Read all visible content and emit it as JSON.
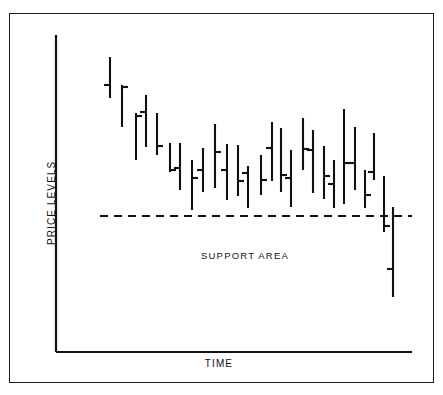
{
  "figure": {
    "frame": {
      "x": 9,
      "y": 13,
      "w": 425,
      "h": 370
    }
  },
  "labels": {
    "y_axis": "PRICE LEVELS",
    "x_axis": "TIME",
    "annotation": "SUPPORT AREA"
  },
  "colors": {
    "ink": "#111111",
    "background": "#ffffff"
  },
  "chart_data": {
    "type": "ohlc-bar",
    "title": "",
    "xlabel": "TIME",
    "ylabel": "PRICE LEVELS",
    "grid": false,
    "legend": "none",
    "axes": {
      "x_axis_y": 352,
      "x_axis_x0": 56,
      "x_axis_x1": 412,
      "y_axis_x": 56,
      "y_axis_y0": 35,
      "y_axis_y1": 352
    },
    "annotations": [
      {
        "text": "SUPPORT AREA",
        "x": 245,
        "y": 255
      },
      {
        "type": "support-line",
        "label": "support level",
        "y": 216,
        "x0": 100,
        "x1": 412,
        "style": "dashed"
      }
    ],
    "note": "Downtrend bar chart breaking below a horizontal support level. Values are pixel y-coordinates: smaller y = higher price.",
    "bars": [
      {
        "i": 1,
        "x": 110,
        "high": 57,
        "low": 98,
        "open": 85,
        "close": null
      },
      {
        "i": 2,
        "x": 122,
        "high": 85,
        "low": 127,
        "open": null,
        "close": 87
      },
      {
        "i": 3,
        "x": 136,
        "high": 113,
        "low": 160,
        "open": null,
        "close": 116
      },
      {
        "i": 4,
        "x": 146,
        "high": 95,
        "low": 147,
        "open": 112,
        "close": null
      },
      {
        "i": 5,
        "x": 157,
        "high": 113,
        "low": 155,
        "open": null,
        "close": 146
      },
      {
        "i": 6,
        "x": 170,
        "high": 143,
        "low": 172,
        "open": null,
        "close": 170
      },
      {
        "i": 7,
        "x": 180,
        "high": 143,
        "low": 190,
        "open": 168,
        "close": null
      },
      {
        "i": 8,
        "x": 192,
        "high": 160,
        "low": 210,
        "open": null,
        "close": 178
      },
      {
        "i": 9,
        "x": 203,
        "high": 148,
        "low": 192,
        "open": 170,
        "close": null
      },
      {
        "i": 10,
        "x": 215,
        "high": 124,
        "low": 188,
        "open": null,
        "close": 152
      },
      {
        "i": 11,
        "x": 227,
        "high": 144,
        "low": 200,
        "open": 170,
        "close": null
      },
      {
        "i": 12,
        "x": 238,
        "high": 145,
        "low": 196,
        "open": null,
        "close": 181
      },
      {
        "i": 13,
        "x": 248,
        "high": 166,
        "low": 208,
        "open": 173,
        "close": null
      },
      {
        "i": 14,
        "x": 261,
        "high": 155,
        "low": 195,
        "open": null,
        "close": 180
      },
      {
        "i": 15,
        "x": 272,
        "high": 122,
        "low": 181,
        "open": 148,
        "close": null
      },
      {
        "i": 16,
        "x": 281,
        "high": 128,
        "low": 192,
        "open": null,
        "close": 175
      },
      {
        "i": 17,
        "x": 291,
        "high": 150,
        "low": 207,
        "open": 178,
        "close": null
      },
      {
        "i": 18,
        "x": 303,
        "high": 118,
        "low": 170,
        "open": null,
        "close": 149
      },
      {
        "i": 19,
        "x": 313,
        "high": 130,
        "low": 193,
        "open": 150,
        "close": null
      },
      {
        "i": 20,
        "x": 324,
        "high": 146,
        "low": 199,
        "open": null,
        "close": 176
      },
      {
        "i": 21,
        "x": 334,
        "high": 160,
        "low": 208,
        "open": 184,
        "close": null
      },
      {
        "i": 22,
        "x": 344,
        "high": 109,
        "low": 204,
        "open": null,
        "close": 163
      },
      {
        "i": 23,
        "x": 355,
        "high": 127,
        "low": 190,
        "open": 163,
        "close": null
      },
      {
        "i": 24,
        "x": 365,
        "high": 170,
        "low": 208,
        "open": null,
        "close": 195
      },
      {
        "i": 25,
        "x": 374,
        "high": 133,
        "low": 180,
        "open": 172,
        "close": null
      },
      {
        "i": 26,
        "x": 384,
        "high": 176,
        "low": 232,
        "open": null,
        "close": 226
      },
      {
        "i": 27,
        "x": 393,
        "high": 207,
        "low": 297,
        "open": 269,
        "close": null
      }
    ]
  }
}
